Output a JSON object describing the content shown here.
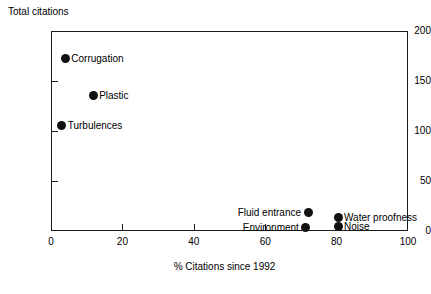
{
  "chart_data": {
    "type": "scatter",
    "title": "",
    "xlabel": "% Citations since 1992",
    "ylabel": "Total citations",
    "xlim": [
      0,
      100
    ],
    "ylim": [
      0,
      200
    ],
    "xticks": [
      0,
      20,
      40,
      60,
      80,
      100
    ],
    "yticks": [
      0,
      50,
      100,
      150,
      200
    ],
    "xtick_labels": [
      "0",
      "20",
      "40",
      "60",
      "80",
      "100"
    ],
    "ytick_labels": [
      "0",
      "50",
      "100",
      "150",
      "200"
    ],
    "grid": false,
    "legend": "none",
    "marker": "filled-circle",
    "marker_color": "#111111",
    "points": [
      {
        "label": "Corrugation",
        "x": 4,
        "y": 173,
        "label_side": "right"
      },
      {
        "label": "Plastic",
        "x": 11.8,
        "y": 136,
        "label_side": "right"
      },
      {
        "label": "Turbulences",
        "x": 3,
        "y": 106,
        "label_side": "right"
      },
      {
        "label": "Fluid entrance",
        "x": 72,
        "y": 19,
        "label_side": "left"
      },
      {
        "label": "Environment",
        "x": 71.4,
        "y": 4,
        "label_side": "left"
      },
      {
        "label": "Water proofness",
        "x": 80.4,
        "y": 14,
        "label_side": "right"
      },
      {
        "label": "Noise",
        "x": 80.4,
        "y": 5,
        "label_side": "right"
      }
    ]
  },
  "axes": {
    "y_title": "Total citations",
    "x_title": "% Citations since 1992"
  }
}
